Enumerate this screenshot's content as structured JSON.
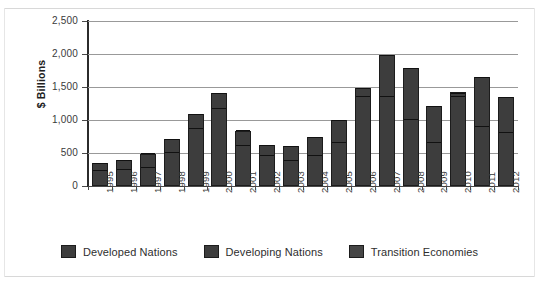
{
  "chart_data": {
    "type": "bar",
    "subtype": "stacked-bar",
    "title": "",
    "xlabel": "",
    "ylabel": "$ Billions",
    "ylim": [
      0,
      2500
    ],
    "ytick_values": [
      0,
      500,
      1000,
      1500,
      2000,
      2500
    ],
    "ytick_labels": [
      "0",
      "500",
      "1,000",
      "1,500",
      "2,000",
      "2,500"
    ],
    "grid": true,
    "legend_position": "bottom",
    "categories": [
      "1995",
      "1996",
      "1997",
      "1998",
      "1999",
      "2000",
      "2001",
      "2002",
      "2003",
      "2004",
      "2005",
      "2006",
      "2007",
      "2008",
      "2009",
      "2010",
      "2011",
      "2012"
    ],
    "series": [
      {
        "name": "Developed Nations",
        "color": "#3d3d3d",
        "values": [
          230,
          250,
          280,
          500,
          860,
          1160,
          610,
          450,
          380,
          450,
          650,
          1350,
          1350,
          1000,
          650,
          1350,
          900,
          800
        ]
      },
      {
        "name": "Developing Nations",
        "color": "#3d3d3d",
        "values": [
          110,
          130,
          200,
          200,
          220,
          240,
          220,
          160,
          210,
          280,
          340,
          120,
          620,
          770,
          540,
          50,
          730,
          530
        ]
      },
      {
        "name": "Transition Economies",
        "color": "#464646",
        "values": [
          10,
          10,
          10,
          10,
          10,
          10,
          10,
          10,
          10,
          10,
          10,
          10,
          20,
          20,
          20,
          20,
          20,
          20
        ]
      }
    ],
    "totals": [
      350,
      390,
      490,
      710,
      1090,
      1410,
      840,
      620,
      600,
      740,
      1000,
      1480,
      1990,
      1790,
      1210,
      1420,
      1650,
      1350
    ]
  },
  "legend": {
    "items": [
      {
        "label": "Developed Nations",
        "swatch": "legend-swatch-developed"
      },
      {
        "label": "Developing Nations",
        "swatch": "legend-swatch-developing"
      },
      {
        "label": "Transition Economies",
        "swatch": "legend-swatch-transition"
      }
    ]
  }
}
